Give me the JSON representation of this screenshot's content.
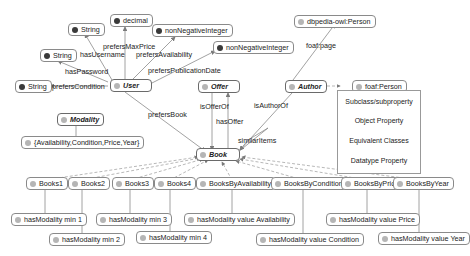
{
  "nodes": {
    "string_username": "String",
    "decimal": "decimal",
    "nonneg_availability": "nonNegativeInteger",
    "nonneg_pubdate": "nonNegativeInteger",
    "string_password": "String",
    "string_condition": "String",
    "user": "User",
    "offer": "Offer",
    "author": "Author",
    "dbpedia_person": "dbpedia-owl:Person",
    "foaf_person": "foaf:Person",
    "modality": "Modality",
    "modality_values": "{Availability,Condition,Price,Year}",
    "book": "Book",
    "books1": "Books1",
    "books2": "Books2",
    "books3": "Books3",
    "books4": "Books4",
    "books_by_availability": "BooksByAvailability",
    "books_by_condition": "BooksByCondition",
    "books_by_price": "BooksByPrice",
    "books_by_year": "BooksByYear",
    "r_min1": "hasModality min 1",
    "r_min2": "hasModality min 2",
    "r_min3": "hasModality min 3",
    "r_min4": "hasModality min 4",
    "r_availability": "hasModality value Availability",
    "r_condition": "hasModality value Condition",
    "r_price": "hasModality value Price",
    "r_year": "hasModality value Year"
  },
  "edges": {
    "hasUsername": "hasUsername",
    "prefersMaxPrice": "prefersMaxPrice",
    "prefersAvailability": "prefersAvailability",
    "prefersPublicationDate": "prefersPublicationDate",
    "hasPassword": "hasPassword",
    "prefersCondition": "prefersCondition",
    "prefersBook": "prefersBook",
    "isOfferOf": "isOfferOf",
    "hasOffer": "hasOffer",
    "isAuthorOf": "isAuthorOf",
    "similarItems": "similarItems",
    "foafPage": "foaf:page"
  },
  "legend": {
    "items": [
      "Subclass/subproperty",
      "Object Property",
      "Equivalent Classes",
      "Datatype Property"
    ]
  },
  "colors": {
    "line": "#8a8a8a",
    "dashed": "#9a9a9a",
    "datatype_dot": "#3a3a3a",
    "class_dot": "#b5b5b5"
  }
}
